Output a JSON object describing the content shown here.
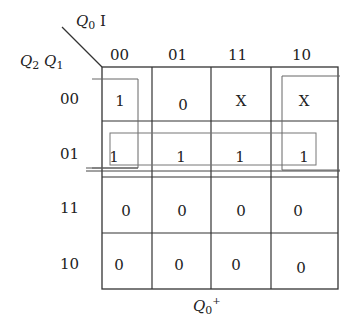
{
  "map": {
    "title_var": "Q",
    "title_sub": "0",
    "title_sup": "+",
    "col_var_1": "Q",
    "col_var_1_sub": "0",
    "col_var_2": "I",
    "row_var_1": "Q",
    "row_var_1_sub": "2",
    "row_var_2": "Q",
    "row_var_2_sub": "1",
    "col_headers": [
      "00",
      "01",
      "11",
      "10"
    ],
    "row_headers": [
      "00",
      "01",
      "11",
      "10"
    ],
    "cells": [
      [
        "1",
        "0",
        "X",
        "X"
      ],
      [
        "1",
        "1",
        "1",
        "1"
      ],
      [
        "0",
        "0",
        "0",
        "0"
      ],
      [
        "0",
        "0",
        "0",
        "0"
      ]
    ],
    "groups": [
      {
        "name": "column-00-rows-00-01"
      },
      {
        "name": "row-01-all-columns"
      },
      {
        "name": "column-10-rows-00-01"
      }
    ]
  }
}
